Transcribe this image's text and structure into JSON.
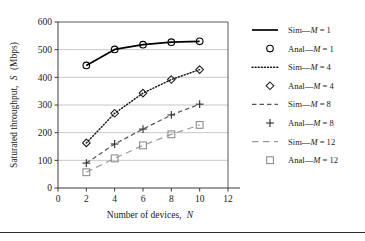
{
  "chart_data": {
    "type": "line",
    "title": "",
    "subtitle": "",
    "xlabel": "Number of devices, N",
    "ylabel": "Saturated throughput, S (Mbps)",
    "xlim": [
      0,
      12
    ],
    "ylim": [
      0,
      600
    ],
    "xticks": [
      0,
      2,
      4,
      6,
      8,
      10,
      12
    ],
    "yticks": [
      0,
      100,
      200,
      300,
      400,
      500,
      600
    ],
    "grid": "horizontal",
    "legend_position": "right",
    "x": [
      2,
      4,
      6,
      8,
      10
    ],
    "series": [
      {
        "name": "Sim—M = 1",
        "style": "solid",
        "marker": "none",
        "color": "#000000",
        "values": [
          443,
          501,
          518,
          527,
          530
        ]
      },
      {
        "name": "Anal—M = 1",
        "style": "none",
        "marker": "circle",
        "color": "#000000",
        "values": [
          443,
          501,
          518,
          527,
          530
        ]
      },
      {
        "name": "Sim—M = 4",
        "style": "dotted",
        "marker": "none",
        "color": "#1a1a1a",
        "values": [
          163,
          270,
          343,
          392,
          428
        ]
      },
      {
        "name": "Anal—M = 4",
        "style": "none",
        "marker": "diamond",
        "color": "#1a1a1a",
        "values": [
          163,
          270,
          343,
          392,
          428
        ]
      },
      {
        "name": "Sim—M = 8",
        "style": "dashed",
        "marker": "none",
        "color": "#555555",
        "values": [
          90,
          159,
          213,
          264,
          303
        ]
      },
      {
        "name": "Anal—M = 8",
        "style": "none",
        "marker": "plus",
        "color": "#333333",
        "values": [
          90,
          159,
          213,
          264,
          303
        ]
      },
      {
        "name": "Sim—M = 12",
        "style": "dashed-long",
        "marker": "none",
        "color": "#9a9a9a",
        "values": [
          57,
          107,
          154,
          194,
          228
        ]
      },
      {
        "name": "Anal—M = 12",
        "style": "none",
        "marker": "square",
        "color": "#8a8a8a",
        "values": [
          57,
          107,
          154,
          194,
          228
        ]
      }
    ]
  },
  "axes": {
    "y_title": "Saturated throughput, S (Mbps)",
    "y_title_plain": "Saturated throughput,",
    "y_title_italic": "S",
    "y_title_units": "(Mbps)",
    "x_title_plain": "Number of devices,",
    "x_title_italic": "N",
    "y_tick_labels": [
      "0",
      "100",
      "200",
      "300",
      "400",
      "500",
      "600"
    ],
    "x_tick_labels": [
      "0",
      "2",
      "4",
      "6",
      "8",
      "10",
      "12"
    ]
  },
  "legend": {
    "entries": [
      {
        "label": "Sim—M = 1",
        "prefix": "Sim—",
        "var": "M",
        "eq": "= 1",
        "swatch": "solid-line",
        "marker": "none"
      },
      {
        "label": "Anal—M = 1",
        "prefix": "Anal—",
        "var": "M",
        "eq": "= 1",
        "swatch": "marker",
        "marker": "circle"
      },
      {
        "label": "Sim—M = 4",
        "prefix": "Sim—",
        "var": "M",
        "eq": "= 4",
        "swatch": "dotted-line",
        "marker": "none"
      },
      {
        "label": "Anal—M = 4",
        "prefix": "Anal—",
        "var": "M",
        "eq": "= 4",
        "swatch": "marker",
        "marker": "diamond"
      },
      {
        "label": "Sim—M = 8",
        "prefix": "Sim—",
        "var": "M",
        "eq": "= 8",
        "swatch": "dashed-line",
        "marker": "none"
      },
      {
        "label": "Anal—M = 8",
        "prefix": "Anal—",
        "var": "M",
        "eq": "= 8",
        "swatch": "marker",
        "marker": "plus"
      },
      {
        "label": "Sim—M = 12",
        "prefix": "Sim—",
        "var": "M",
        "eq": "= 12",
        "swatch": "dashed-long-line",
        "marker": "none"
      },
      {
        "label": "Anal—M = 12",
        "prefix": "Anal—",
        "var": "M",
        "eq": "= 12",
        "swatch": "marker",
        "marker": "square"
      }
    ]
  },
  "colors": {
    "series_m1": "#000000",
    "series_m4": "#1a1a1a",
    "series_m8": "#555555",
    "series_m12": "#9a9a9a",
    "grid": "#b8b8b8",
    "axis": "#3a3a3a",
    "background": "#ffffff"
  }
}
